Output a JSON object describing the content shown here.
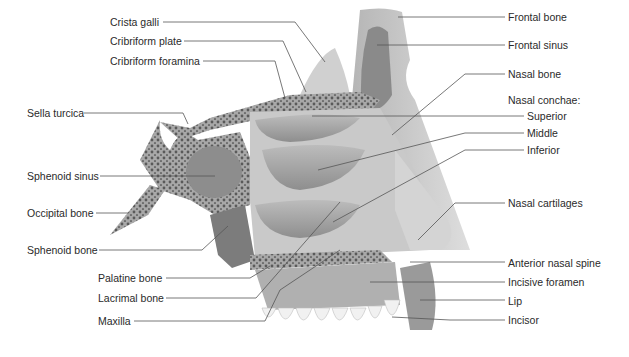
{
  "diagram": {
    "colors": {
      "background": "#ffffff",
      "text": "#2a2a2a",
      "leader_line": "#555555",
      "bone_light": "#d9d9d9",
      "bone_mid": "#bdbdbd",
      "bone_dark": "#8c8c8c",
      "cavity_dark": "#6e6e6e",
      "teeth": "#f2f2f2"
    },
    "labels_left": [
      {
        "id": "crista-galli",
        "text": "Crista galli",
        "x": 110,
        "y": 16,
        "anchor": [
          110,
          22
        ],
        "line": [
          [
            163,
            22
          ],
          [
            295,
            22
          ],
          [
            325,
            62
          ]
        ]
      },
      {
        "id": "cribriform-plate",
        "text": "Cribriform plate",
        "x": 110,
        "y": 35,
        "anchor": [
          110,
          41
        ],
        "line": [
          [
            184,
            41
          ],
          [
            283,
            41
          ],
          [
            306,
            92
          ]
        ]
      },
      {
        "id": "cribriform-foramina",
        "text": "Cribriform foramina",
        "x": 110,
        "y": 55,
        "anchor": [
          110,
          61
        ],
        "line": [
          [
            203,
            61
          ],
          [
            275,
            61
          ],
          [
            285,
            98
          ]
        ]
      },
      {
        "id": "sella-turcica",
        "text": "Sella turcica",
        "x": 27,
        "y": 107,
        "anchor": [
          27,
          113
        ],
        "line": [
          [
            84,
            113
          ],
          [
            183,
            113
          ],
          [
            188,
            124
          ]
        ]
      },
      {
        "id": "sphenoid-sinus",
        "text": "Sphenoid sinus",
        "x": 27,
        "y": 170,
        "anchor": [
          27,
          176
        ],
        "line": [
          [
            100,
            176
          ],
          [
            215,
            176
          ]
        ]
      },
      {
        "id": "occipital-bone",
        "text": "Occipital bone",
        "x": 27,
        "y": 207,
        "anchor": [
          27,
          213
        ],
        "line": [
          [
            96,
            213
          ],
          [
            128,
            213
          ]
        ]
      },
      {
        "id": "sphenoid-bone",
        "text": "Sphenoid bone",
        "x": 27,
        "y": 244,
        "anchor": [
          27,
          250
        ],
        "line": [
          [
            99,
            250
          ],
          [
            202,
            250
          ],
          [
            228,
            226
          ]
        ]
      },
      {
        "id": "palatine-bone",
        "text": "Palatine bone",
        "x": 98,
        "y": 272,
        "anchor": [
          98,
          278
        ],
        "line": [
          [
            166,
            278
          ],
          [
            250,
            278
          ],
          [
            270,
            266
          ]
        ]
      },
      {
        "id": "lacrimal-bone",
        "text": "Lacrimal bone",
        "x": 98,
        "y": 292,
        "anchor": [
          98,
          298
        ],
        "line": [
          [
            166,
            298
          ],
          [
            256,
            298
          ],
          [
            340,
            202
          ]
        ]
      },
      {
        "id": "maxilla",
        "text": "Maxilla",
        "x": 98,
        "y": 315,
        "anchor": [
          98,
          321
        ],
        "line": [
          [
            134,
            321
          ],
          [
            265,
            321
          ],
          [
            280,
            290
          ],
          [
            340,
            250
          ]
        ]
      }
    ],
    "labels_right": [
      {
        "id": "frontal-bone",
        "text": "Frontal bone",
        "x": 508,
        "y": 11,
        "line": [
          [
            505,
            17
          ],
          [
            398,
            17
          ]
        ]
      },
      {
        "id": "frontal-sinus",
        "text": "Frontal sinus",
        "x": 508,
        "y": 39,
        "line": [
          [
            505,
            45
          ],
          [
            377,
            45
          ]
        ]
      },
      {
        "id": "nasal-bone",
        "text": "Nasal bone",
        "x": 508,
        "y": 68,
        "line": [
          [
            505,
            74
          ],
          [
            465,
            74
          ],
          [
            392,
            135
          ]
        ]
      },
      {
        "id": "nasal-conchae",
        "text": "Nasal conchae:",
        "x": 508,
        "y": 94,
        "line": []
      },
      {
        "id": "superior",
        "text": "Superior",
        "x": 527,
        "y": 110,
        "line": [
          [
            524,
            116
          ],
          [
            312,
            116
          ]
        ]
      },
      {
        "id": "middle",
        "text": "Middle",
        "x": 527,
        "y": 127,
        "line": [
          [
            524,
            133
          ],
          [
            465,
            133
          ],
          [
            318,
            170
          ]
        ]
      },
      {
        "id": "inferior",
        "text": "Inferior",
        "x": 527,
        "y": 144,
        "line": [
          [
            524,
            150
          ],
          [
            465,
            150
          ],
          [
            333,
            222
          ]
        ]
      },
      {
        "id": "nasal-cartilages",
        "text": "Nasal cartilages",
        "x": 508,
        "y": 197,
        "line": [
          [
            505,
            203
          ],
          [
            455,
            203
          ],
          [
            418,
            240
          ]
        ]
      },
      {
        "id": "anterior-nasal-spine",
        "text": "Anterior nasal spine",
        "x": 508,
        "y": 257,
        "line": [
          [
            505,
            262
          ],
          [
            410,
            262
          ]
        ]
      },
      {
        "id": "incisive-foramen",
        "text": "Incisive foramen",
        "x": 508,
        "y": 276,
        "line": [
          [
            505,
            282
          ],
          [
            370,
            282
          ]
        ]
      },
      {
        "id": "lip",
        "text": "Lip",
        "x": 508,
        "y": 295,
        "line": [
          [
            505,
            300
          ],
          [
            420,
            300
          ]
        ]
      },
      {
        "id": "incisor",
        "text": "Incisor",
        "x": 508,
        "y": 314,
        "line": [
          [
            505,
            320
          ],
          [
            450,
            320
          ],
          [
            392,
            317
          ]
        ]
      }
    ]
  }
}
